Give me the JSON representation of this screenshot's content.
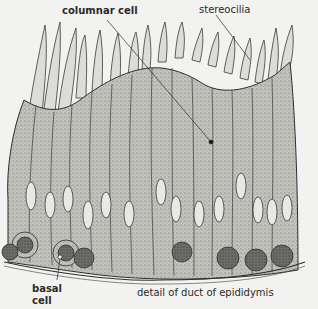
{
  "figure": {
    "title": "detail of duct of epididymis",
    "labels": {
      "columnar_cell": "columnar cell",
      "stereocilia": "stereocilia",
      "basal_cell_line1": "basal",
      "basal_cell_line2": "cell"
    },
    "caption": "detail of duct of epididymis",
    "colors": {
      "background": "#f2f2f0",
      "cytoplasm": "#b9b9b4",
      "outline": "#3a3a3a",
      "nucleus_fill": "#e8e8e4",
      "basal_nucleus": "#4a4a48"
    }
  }
}
